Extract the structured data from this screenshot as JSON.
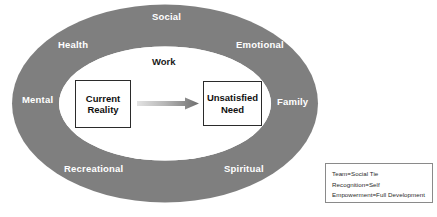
{
  "diagram": {
    "type": "life-domains-ellipse-process",
    "ring_color": "#7f7f7f",
    "ring_text_color": "#ffffff",
    "field_color": "#ffffff",
    "box_border_color": "#2b2b2b",
    "arrow_color": "#808080",
    "ring_labels": [
      {
        "id": "social",
        "label": "Social"
      },
      {
        "id": "health",
        "label": "Health"
      },
      {
        "id": "emotional",
        "label": "Emotional"
      },
      {
        "id": "mental",
        "label": "Mental"
      },
      {
        "id": "family",
        "label": "Family"
      },
      {
        "id": "recreational",
        "label": "Recreational"
      },
      {
        "id": "spiritual",
        "label": "Spiritual"
      }
    ],
    "inner_labels": [
      {
        "id": "work",
        "label": "Work"
      }
    ],
    "nodes": [
      {
        "id": "current-reality",
        "label": "Current\nReality"
      },
      {
        "id": "unsatisfied-need",
        "label": "Unsatisfied\nNeed"
      }
    ],
    "arrow": {
      "from": "current-reality",
      "to": "unsatisfied-need",
      "label": ""
    }
  },
  "legend": {
    "lines": [
      "Team=Social Tie",
      "Recognition=Self",
      "Empowerment=Full Development"
    ]
  }
}
